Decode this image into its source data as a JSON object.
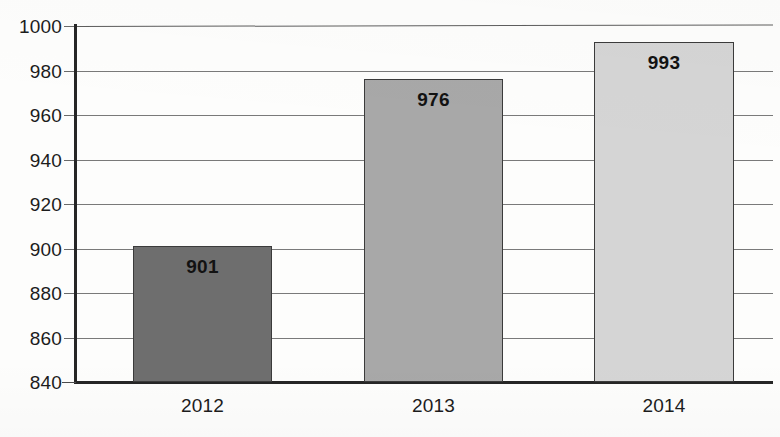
{
  "chart_data": {
    "type": "bar",
    "title": "",
    "subtitle": "",
    "xlabel": "",
    "ylabel": "",
    "categories": [
      "2012",
      "2013",
      "2014"
    ],
    "values": [
      901,
      976,
      993
    ],
    "value_labels": [
      "901",
      "976",
      "993"
    ],
    "series": [
      {
        "name": "",
        "values": [
          901,
          976,
          993
        ]
      }
    ],
    "ylim": [
      840,
      1000
    ],
    "ytick_step": 20,
    "ytick_labels": [
      "1000",
      "980",
      "960",
      "940",
      "920",
      "900",
      "880",
      "860",
      "840"
    ],
    "ytick_values": [
      1000,
      980,
      960,
      940,
      920,
      900,
      880,
      860,
      840
    ],
    "grid": true,
    "legend": false,
    "legend_position": "none",
    "bar_colors": [
      "#6e6e6e",
      "#a8a8a8",
      "#d5d5d5"
    ],
    "bar_border_color": "#3b3b3b",
    "axis_color": "#262626",
    "gridline_color": "#5d5d5d",
    "background_color": "#fdfdfc",
    "annotations": []
  }
}
